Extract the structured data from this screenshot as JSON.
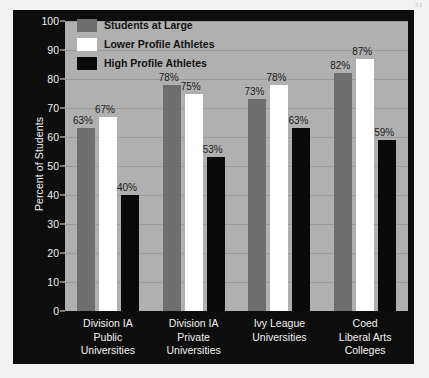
{
  "page_mark": "51",
  "chart_data": {
    "type": "bar",
    "title": "",
    "xlabel": "",
    "ylabel": "Percent of Students",
    "ylim": [
      0,
      100
    ],
    "ytick_step": 10,
    "yticks": [
      0,
      10,
      20,
      30,
      40,
      50,
      60,
      70,
      80,
      90,
      100
    ],
    "grid": true,
    "legend_position": "top-left",
    "value_suffix": "%",
    "categories": [
      "Division IA Public Universities",
      "Division IA Private Universities",
      "Ivy League Universities",
      "Coed Liberal Arts Colleges"
    ],
    "category_lines": [
      [
        "Division IA",
        "Public",
        "Universities"
      ],
      [
        "Division IA",
        "Private",
        "Universities"
      ],
      [
        "Ivy League",
        "Universities"
      ],
      [
        "Coed",
        "Liberal Arts",
        "Colleges"
      ]
    ],
    "series": [
      {
        "name": "Students at Large",
        "color": "#6e6e6e",
        "values": [
          63,
          78,
          73,
          82
        ],
        "labels": [
          "63%",
          "78%",
          "73%",
          "82%"
        ]
      },
      {
        "name": "Lower Profile Athletes",
        "color": "#ffffff",
        "values": [
          67,
          75,
          78,
          87
        ],
        "labels": [
          "67%",
          "75%",
          "78%",
          "87%"
        ]
      },
      {
        "name": "High Profile Athletes",
        "color": "#0a0a0a",
        "values": [
          40,
          53,
          63,
          59
        ],
        "labels": [
          "40%",
          "53%",
          "63%",
          "59%"
        ]
      }
    ]
  },
  "colors": {
    "panel_background": "#0d0d0d",
    "plot_background": "#b0b0b0",
    "gridline": "#9a9a9a",
    "axis_text": "#f2f2f2",
    "label_text": "#1b1b1b"
  }
}
